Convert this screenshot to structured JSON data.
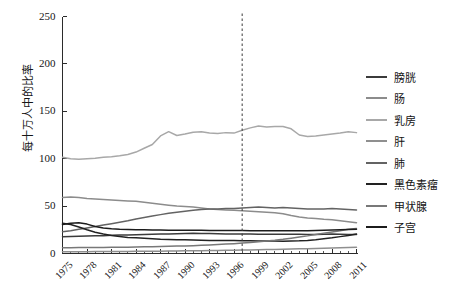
{
  "chart_data": {
    "type": "line",
    "title": "",
    "xlabel": "",
    "ylabel": "每十万人中的比率",
    "ylim": [
      0,
      250
    ],
    "xlim": [
      1975,
      2011
    ],
    "grid": false,
    "legend_position": "right",
    "yticks": [
      0,
      50,
      100,
      150,
      200,
      250
    ],
    "xticks": [
      1975,
      1978,
      1981,
      1984,
      1987,
      1990,
      1993,
      1996,
      1999,
      2002,
      2005,
      2008,
      2011
    ],
    "x": [
      1975,
      1976,
      1977,
      1978,
      1979,
      1980,
      1981,
      1982,
      1983,
      1984,
      1985,
      1986,
      1987,
      1988,
      1989,
      1990,
      1991,
      1992,
      1993,
      1994,
      1995,
      1996,
      1997,
      1998,
      1999,
      2000,
      2001,
      2002,
      2003,
      2004,
      2005,
      2006,
      2007,
      2008,
      2009,
      2010,
      2011
    ],
    "annotations": [
      {
        "type": "vline",
        "x": 1997,
        "style": "dashed",
        "color": "#3a3a3a"
      }
    ],
    "series": [
      {
        "name": "膀胱",
        "color": "#3b3b3b",
        "values": [
          17.8,
          17.9,
          18.2,
          18.4,
          18.6,
          18.8,
          19.2,
          19.4,
          19.6,
          19.9,
          20.1,
          20.4,
          20.6,
          20.7,
          20.9,
          21.1,
          21.3,
          21.2,
          21.0,
          20.8,
          20.7,
          20.6,
          20.5,
          20.5,
          20.4,
          20.4,
          20.3,
          20.3,
          20.2,
          20.2,
          20.1,
          20.1,
          20.3,
          20.5,
          20.3,
          20.1,
          20.0
        ]
      },
      {
        "name": "肠",
        "color": "#8c8c8c",
        "values": [
          59.0,
          59.5,
          59.0,
          58.0,
          57.5,
          57.0,
          56.5,
          56.0,
          55.5,
          55.0,
          54.0,
          53.0,
          52.0,
          51.0,
          50.0,
          49.5,
          49.0,
          48.0,
          47.0,
          46.5,
          46.0,
          45.5,
          45.0,
          44.5,
          44.0,
          43.5,
          43.0,
          42.0,
          40.0,
          38.5,
          37.5,
          36.8,
          36.0,
          35.5,
          34.5,
          33.5,
          32.5
        ]
      },
      {
        "name": "乳房",
        "color": "#a8a8a8",
        "values": [
          101.5,
          100.0,
          99.5,
          100.0,
          100.5,
          101.5,
          102.0,
          103.0,
          104.5,
          107.0,
          111.0,
          115.0,
          124.0,
          128.5,
          124.5,
          126.0,
          128.0,
          128.5,
          127.0,
          126.5,
          127.5,
          127.0,
          130.0,
          132.5,
          134.5,
          133.5,
          134.0,
          134.0,
          131.5,
          125.0,
          123.5,
          124.0,
          125.0,
          126.0,
          127.0,
          128.5,
          127.5
        ]
      },
      {
        "name": "肝",
        "color": "#8f8f8f",
        "values": [
          1.8,
          1.8,
          1.9,
          1.9,
          2.0,
          2.0,
          2.1,
          2.1,
          2.2,
          2.3,
          2.4,
          2.5,
          2.5,
          2.6,
          2.7,
          2.8,
          2.9,
          3.0,
          3.1,
          3.2,
          3.3,
          3.4,
          3.6,
          3.7,
          3.9,
          4.1,
          4.3,
          4.5,
          4.7,
          4.9,
          5.1,
          5.3,
          5.6,
          5.8,
          6.1,
          6.4,
          6.6
        ]
      },
      {
        "name": "肺",
        "color": "#636363",
        "values": [
          23.0,
          24.0,
          25.5,
          27.0,
          28.5,
          30.0,
          31.5,
          33.0,
          34.5,
          36.5,
          38.0,
          39.5,
          41.0,
          42.5,
          43.5,
          44.5,
          45.5,
          46.5,
          47.0,
          47.0,
          47.5,
          47.5,
          48.0,
          48.5,
          49.0,
          48.5,
          48.0,
          48.5,
          48.0,
          47.5,
          47.0,
          47.0,
          47.0,
          47.5,
          47.0,
          46.5,
          46.0
        ]
      },
      {
        "name": "黑色素瘤",
        "color": "#222222",
        "values": [
          32.0,
          30.5,
          28.0,
          25.0,
          22.5,
          20.5,
          19.0,
          18.0,
          17.0,
          16.5,
          16.0,
          15.5,
          15.0,
          14.8,
          14.6,
          14.4,
          14.2,
          14.0,
          13.8,
          13.8,
          13.7,
          13.6,
          13.5,
          13.4,
          13.3,
          13.2,
          13.1,
          13.0,
          13.2,
          13.4,
          13.8,
          14.5,
          15.5,
          16.5,
          17.8,
          19.0,
          20.5
        ]
      },
      {
        "name": "甲状腺",
        "color": "#787878",
        "values": [
          6.0,
          6.1,
          6.2,
          6.3,
          6.3,
          6.4,
          6.5,
          6.6,
          6.7,
          6.8,
          7.0,
          7.2,
          7.4,
          7.6,
          7.8,
          8.0,
          8.3,
          8.6,
          9.0,
          9.4,
          9.9,
          10.4,
          11.0,
          11.7,
          12.4,
          13.2,
          14.0,
          15.0,
          16.2,
          17.4,
          18.6,
          20.0,
          21.5,
          22.8,
          24.0,
          25.5,
          26.5
        ]
      },
      {
        "name": "子宫",
        "color": "#1c1c1c",
        "values": [
          30.5,
          32.0,
          32.5,
          31.0,
          28.5,
          27.0,
          26.0,
          25.5,
          25.2,
          25.0,
          25.0,
          24.8,
          24.8,
          24.6,
          24.5,
          24.5,
          24.4,
          24.4,
          24.3,
          24.3,
          24.2,
          24.2,
          24.2,
          24.1,
          24.1,
          24.1,
          24.0,
          24.0,
          24.0,
          24.0,
          24.0,
          24.2,
          24.5,
          24.8,
          25.0,
          25.2,
          25.5
        ]
      }
    ]
  },
  "axis": {
    "y_title": "每十万人中的比率"
  }
}
